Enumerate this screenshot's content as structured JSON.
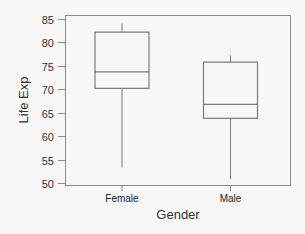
{
  "chart_data": {
    "type": "box",
    "title": "",
    "xlabel": "Gender",
    "ylabel": "Life Exp",
    "ylim": [
      50,
      85
    ],
    "yticks": [
      50,
      55,
      60,
      65,
      70,
      75,
      80,
      85
    ],
    "yticklabels": [
      "50",
      "55",
      "60",
      "65",
      "70",
      "75",
      "80",
      "85"
    ],
    "categories": [
      "Female",
      "Male"
    ],
    "series": [
      {
        "name": "Female",
        "whisker_low": 53.3,
        "q1": 70.2,
        "median": 73.7,
        "q3": 82.2,
        "whisker_high": 84.0
      },
      {
        "name": "Male",
        "whisker_low": 50.8,
        "q1": 63.8,
        "median": 66.8,
        "q3": 75.8,
        "whisker_high": 77.3
      }
    ],
    "grid": false,
    "legend": null
  },
  "colors": {
    "background": "#f7f7f7",
    "line": "#7a7a7a",
    "text": "#333333"
  }
}
